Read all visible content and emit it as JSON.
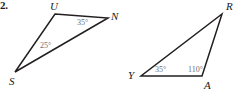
{
  "figure": {
    "problem_number": "2.",
    "background_color": "#ffffff",
    "stroke_color": "#231f20",
    "label_color": "#1a1a1a",
    "angle_text_color": "#6e6e70",
    "width": 245,
    "height": 93
  },
  "triangles": [
    {
      "id": "triangle-sun",
      "name": "triangle-SUN",
      "vertices": [
        {
          "label": "U",
          "x": 55,
          "y": 14,
          "label_x": 50,
          "label_y": 1
        },
        {
          "label": "N",
          "x": 108,
          "y": 18,
          "label_x": 111,
          "label_y": 11
        },
        {
          "label": "S",
          "x": 15,
          "y": 72,
          "label_x": 9,
          "label_y": 76
        }
      ],
      "angles": [
        {
          "at": "N",
          "value": "35",
          "degree_symbol": "°",
          "text": "35°",
          "x": 77,
          "y": 19
        },
        {
          "at": "S",
          "value": "25",
          "degree_symbol": "°",
          "text": "25°",
          "x": 40,
          "y": 42
        }
      ]
    },
    {
      "id": "triangle-yar",
      "name": "triangle-YAR",
      "vertices": [
        {
          "label": "R",
          "x": 222,
          "y": 14,
          "label_x": 226,
          "label_y": 1
        },
        {
          "label": "A",
          "x": 202,
          "y": 76,
          "label_x": 204,
          "label_y": 80
        },
        {
          "label": "Y",
          "x": 141,
          "y": 76,
          "label_x": 128,
          "label_y": 70
        }
      ],
      "angles": [
        {
          "at": "Y",
          "value": "35",
          "degree_symbol": "°",
          "text": "35°",
          "x": 155,
          "y": 66
        },
        {
          "at": "A",
          "value": "110",
          "degree_symbol": "°",
          "text": "110°",
          "x": 188,
          "y": 66
        }
      ]
    }
  ]
}
